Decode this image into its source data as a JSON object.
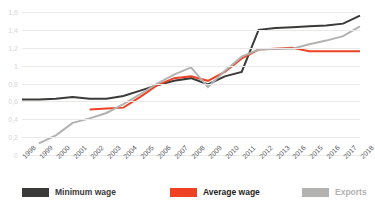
{
  "chart_data": {
    "type": "line",
    "title": "",
    "subtitle": "",
    "xlabel": "",
    "ylabel": "",
    "grid": true,
    "legend_position": "bottom",
    "ylim": [
      0,
      1.6
    ],
    "yticks": [
      "0",
      "0,2",
      "0,4",
      "0,6",
      "0,8",
      "1",
      "1,2",
      "1,4",
      "1,6"
    ],
    "ytick_values": [
      0,
      0.2,
      0.4,
      0.6,
      0.8,
      1.0,
      1.2,
      1.4,
      1.6
    ],
    "categories": [
      "1998",
      "1999",
      "2000",
      "2001",
      "2002",
      "2003",
      "2004",
      "2005",
      "2006",
      "2007",
      "2008",
      "2009",
      "2010",
      "2011",
      "2012",
      "2013",
      "2016",
      "2015",
      "2016",
      "2017",
      "2018"
    ],
    "x": [
      1998,
      1999,
      2000,
      2001,
      2002,
      2003,
      2004,
      2005,
      2006,
      2007,
      2008,
      2009,
      2010,
      2011,
      2012,
      2013,
      2014,
      2015,
      2016,
      2017,
      2018
    ],
    "series": [
      {
        "name": "Minimum wage",
        "color": "#3a3a38",
        "values": [
          0.62,
          0.62,
          0.63,
          0.65,
          0.63,
          0.63,
          0.66,
          0.72,
          0.78,
          0.83,
          0.86,
          0.79,
          0.88,
          0.93,
          1.4,
          1.42,
          1.43,
          1.44,
          1.45,
          1.47,
          1.56
        ]
      },
      {
        "name": "Average wage",
        "color": "#ef4123",
        "values": [
          null,
          null,
          null,
          null,
          0.51,
          0.52,
          0.53,
          0.65,
          0.78,
          0.86,
          0.88,
          0.83,
          0.93,
          1.08,
          1.18,
          1.19,
          1.2,
          1.16,
          1.16,
          1.16,
          1.16
        ]
      },
      {
        "name": "Exports",
        "color": "#b2b2b0",
        "values": [
          null,
          0.13,
          0.22,
          0.36,
          0.41,
          0.47,
          0.57,
          0.68,
          0.8,
          0.9,
          0.98,
          0.76,
          0.94,
          1.1,
          1.18,
          1.19,
          1.19,
          1.24,
          1.28,
          1.33,
          1.44
        ]
      }
    ]
  },
  "legend": {
    "items": [
      {
        "label": "Minimum wage",
        "color": "#3a3a38",
        "text_color": "#3a3a38"
      },
      {
        "label": "Average wage",
        "color": "#ef4123",
        "text_color": "#231f20"
      },
      {
        "label": "Exports",
        "color": "#b2b2b0",
        "text_color": "#b2b2b0"
      }
    ]
  }
}
